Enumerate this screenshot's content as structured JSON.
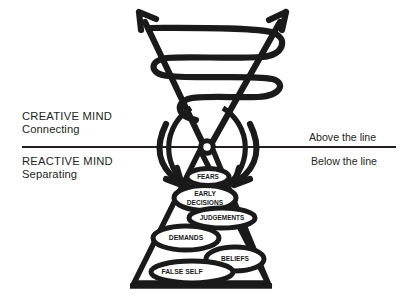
{
  "diagram": {
    "title_absent": true,
    "left_labels": {
      "creative_heading": "CREATIVE MIND",
      "creative_sub": "Connecting",
      "reactive_heading": "REACTIVE MIND",
      "reactive_sub": "Separating"
    },
    "right_labels": {
      "above": "Above the line",
      "below": "Below the line"
    },
    "nodes": [
      {
        "label": "FEARS",
        "size": 6.4
      },
      {
        "label": "EARLY",
        "size": 6.6
      },
      {
        "label": "DECISIONS",
        "size": 6.6
      },
      {
        "label": "JUDGEMENTS",
        "size": 6.4
      },
      {
        "label": "DEMANDS",
        "size": 6.8
      },
      {
        "label": "BELIEFS",
        "size": 6.6
      },
      {
        "label": "FALSE SELF",
        "size": 6.8
      }
    ],
    "colors": {
      "ink": "#1a1a1a",
      "text": "#231f20",
      "background": "#ffffff"
    }
  }
}
